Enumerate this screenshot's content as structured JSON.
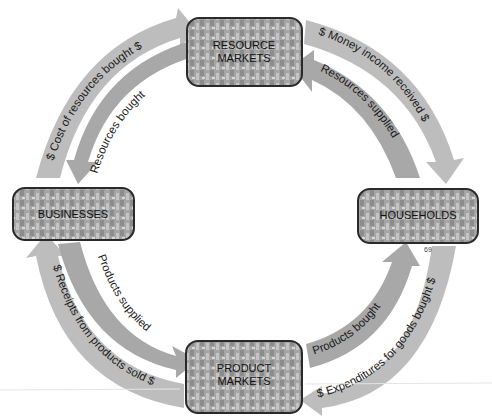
{
  "diagram": {
    "type": "circular-flow",
    "nodes": {
      "resource_markets": {
        "line1": "RESOURCE",
        "line2": "MARKETS"
      },
      "businesses": {
        "label": "BUSINESSES"
      },
      "households": {
        "label": "HOUSEHOLDS"
      },
      "product_markets": {
        "line1": "PRODUCT",
        "line2": "MARKETS"
      }
    },
    "flows": {
      "cost_of_resources": "$ Cost of resources bought $",
      "resources_bought": "Resources bought",
      "money_income": "$ Money income received $",
      "resources_supplied": "Resources supplied",
      "receipts_from_products": "$ Receipts from products sold $",
      "products_supplied": "Products supplied",
      "products_bought": "Products bought",
      "expenditures": "$ Expenditures for goods bought $"
    },
    "page_number": "69",
    "colors": {
      "arrow": "#b9b9b9",
      "box_fill": "#9a9a9a",
      "box_border": "#2a2a2a"
    }
  }
}
